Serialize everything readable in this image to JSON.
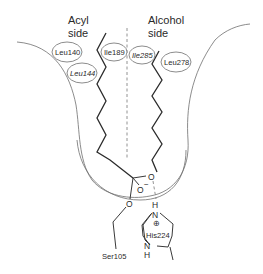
{
  "diagram": {
    "type": "enzyme-active-site-schematic",
    "regions": {
      "acyl_side": {
        "line1": "Acyl",
        "line2": "side"
      },
      "alcohol_side": {
        "line1": "Alcohol",
        "line2": "side"
      }
    },
    "residues": {
      "leu140": "Leu140",
      "leu144": "Leu144",
      "ile189": "Ile189",
      "ile285": "Ile285",
      "leu278": "Leu278",
      "ser105": "Ser105",
      "his224": "His224"
    },
    "atoms": {
      "ester_oxygen": "O",
      "oxyanion": "O",
      "oxyanion_charge": "−",
      "ser_oxygen": "O",
      "his_h_top": "H",
      "his_n_top": "N",
      "his_charge": "⊕",
      "his_n_bottom": "N",
      "his_h_bottom": "H"
    },
    "colors": {
      "outline": "#6f6f6f",
      "chain": "#2b2b2b",
      "text": "#2a2a2a"
    }
  }
}
